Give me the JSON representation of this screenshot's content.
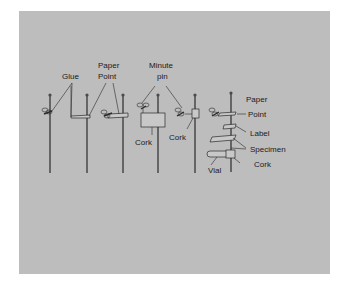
{
  "figure": {
    "background_color": "#bdbdbd",
    "labels": {
      "glue": "Glue",
      "paper_point_1_line1": "Paper",
      "paper_point_1_line2": "Point",
      "minute_pin_line1": "Minute",
      "minute_pin_line2": "pin",
      "cork_1": "Cork",
      "cork_2": "Cork",
      "paper_point_2_line1": "Paper",
      "paper_point_2_line2": "Point",
      "label": "Label",
      "specimen": "Specimen",
      "cork_3": "Cork",
      "vial": "Vial"
    }
  }
}
